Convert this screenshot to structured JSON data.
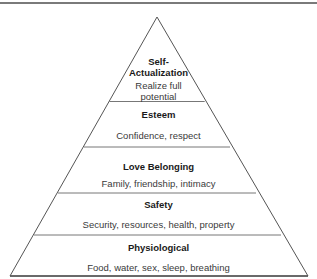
{
  "diagram": {
    "type": "pyramid",
    "levels": [
      {
        "title": "Self-\nActualization",
        "title_line1": "Self-",
        "title_line2": "Actualization",
        "description": "Realize full potential",
        "desc_line1": "Realize full",
        "desc_line2": "potential"
      },
      {
        "title": "Esteem",
        "description": "Confidence, respect"
      },
      {
        "title": "Love Belonging",
        "description": "Family, friendship, intimacy"
      },
      {
        "title": "Safety",
        "description": "Security, resources, health, property"
      },
      {
        "title": "Physiological",
        "description": "Food, water, sex, sleep, breathing"
      }
    ],
    "colors": {
      "stroke": "#555555",
      "top_rule": "#7a7a7a",
      "fill": "#ffffff"
    }
  }
}
